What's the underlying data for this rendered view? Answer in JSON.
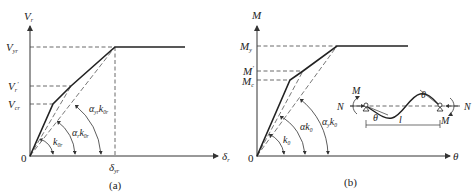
{
  "panel_a": {
    "caption": "(a)",
    "y_axis_label": "V",
    "y_axis_sub": "r",
    "x_axis_label": "δ",
    "x_axis_sub": "r",
    "origin_label": "0",
    "y_ticks": [
      {
        "base": "V",
        "sub": "yr",
        "sup": ""
      },
      {
        "base": "V",
        "sub": "r",
        "sup": "'"
      },
      {
        "base": "V",
        "sub": "cr",
        "sup": ""
      }
    ],
    "x_tick": {
      "base": "δ",
      "sub": "yr"
    },
    "angle_labels": [
      {
        "pre": "",
        "k": "k",
        "sub": "0r"
      },
      {
        "pre": "α",
        "pre_sub": "r",
        "k": "k",
        "sub": "0r"
      },
      {
        "pre": "α",
        "pre_sub": "yr",
        "k": "k",
        "sub": "0r"
      }
    ]
  },
  "panel_b": {
    "caption": "(b)",
    "y_axis_label": "M",
    "x_axis_label": "θ",
    "origin_label": "0",
    "y_ticks": [
      {
        "base": "M",
        "sub": "y",
        "sup": ""
      },
      {
        "base": "M",
        "sub": "",
        "sup": "'"
      },
      {
        "base": "M",
        "sub": "c",
        "sup": ""
      }
    ],
    "angle_labels": [
      {
        "pre": "",
        "k": "k",
        "sub": "0"
      },
      {
        "pre": "α",
        "pre_sub": "",
        "k": "k",
        "sub": "0"
      },
      {
        "pre": "α",
        "pre_sub": "y",
        "k": "k",
        "sub": "0"
      }
    ],
    "inset": {
      "left_force": "N",
      "right_force": "N",
      "left_moment": "M",
      "right_moment": "M",
      "left_rotation": "θ",
      "right_rotation": "θ",
      "length": "l"
    }
  }
}
